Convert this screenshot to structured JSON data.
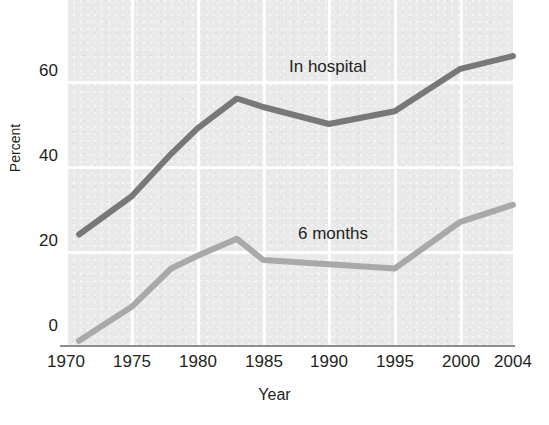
{
  "chart_data": {
    "type": "line",
    "title": "",
    "subtitle": "",
    "xlabel": "Year",
    "ylabel": "Percent",
    "xlim": [
      1970,
      2004
    ],
    "ylim": [
      0,
      72
    ],
    "xticks": [
      "1970",
      "1975",
      "1980",
      "1985",
      "1990",
      "1995",
      "2000",
      "2004"
    ],
    "xtick_values": [
      1970,
      1975,
      1980,
      1985,
      1990,
      1995,
      2000,
      2004
    ],
    "yticks": [
      "0",
      "20",
      "40",
      "60"
    ],
    "ytick_values": [
      0,
      20,
      40,
      60
    ],
    "grid": true,
    "grid_color": "#fdfdfd",
    "plot_background": "#e9e9e9",
    "figure_background": "#ffffff",
    "legend_position": "inline-annotation",
    "series": [
      {
        "name": "In hospital",
        "color": "#787878",
        "label_position": {
          "x": 289,
          "y": 57
        },
        "x": [
          1971,
          1975,
          1978,
          1980,
          1983,
          1985,
          1990,
          1995,
          2000,
          2004
        ],
        "values": [
          26,
          35,
          45,
          51,
          58,
          56,
          52,
          55,
          65,
          68
        ]
      },
      {
        "name": "6 months",
        "color": "#a9a9a9",
        "label_position": {
          "x": 298,
          "y": 224
        },
        "x": [
          1971,
          1975,
          1978,
          1980,
          1983,
          1985,
          1990,
          1995,
          2000,
          2004
        ],
        "values": [
          1,
          9,
          18,
          21,
          25,
          20,
          19,
          18,
          29,
          33
        ]
      }
    ],
    "annotations": [
      {
        "text": "In hospital",
        "x": 289,
        "y": 57
      },
      {
        "text": "6 months",
        "x": 298,
        "y": 224
      }
    ]
  },
  "axis": {
    "y_label": "Percent",
    "x_label": "Year",
    "y_ticks": [
      {
        "label": "60",
        "top": 62
      },
      {
        "label": "40",
        "top": 147
      },
      {
        "label": "20",
        "top": 232
      },
      {
        "label": "0",
        "top": 317
      }
    ],
    "x_ticks": [
      {
        "label": "1970",
        "left": 66
      },
      {
        "label": "1975",
        "left": 132
      },
      {
        "label": "1980",
        "left": 198
      },
      {
        "label": "1985",
        "left": 264
      },
      {
        "label": "1990",
        "left": 329
      },
      {
        "label": "1995",
        "left": 395
      },
      {
        "label": "2000",
        "left": 461
      },
      {
        "label": "2004",
        "left": 513
      }
    ]
  },
  "colors": {
    "in_hospital_line": "#787878",
    "six_months_line": "#a9a9a9",
    "plot_bg": "#e9e9e9",
    "gridline": "#fdfdfd",
    "axis_line": "#8d8d8d",
    "text": "#231f20"
  }
}
